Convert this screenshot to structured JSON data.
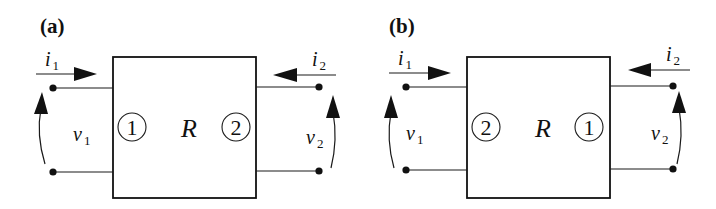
{
  "diagram": {
    "panels": [
      {
        "id": "a",
        "label": "(a)",
        "block_label": "R",
        "left_port_number": "1",
        "right_port_number": "2",
        "current_left": {
          "symbol": "i",
          "subscript": "1"
        },
        "current_right": {
          "symbol": "i",
          "subscript": "2"
        },
        "voltage_left": {
          "symbol": "v",
          "subscript": "1"
        },
        "voltage_right": {
          "symbol": "v",
          "subscript": "2"
        }
      },
      {
        "id": "b",
        "label": "(b)",
        "block_label": "R",
        "left_port_number": "2",
        "right_port_number": "1",
        "current_left": {
          "symbol": "i",
          "subscript": "1"
        },
        "current_right": {
          "symbol": "i",
          "subscript": "2"
        },
        "voltage_left": {
          "symbol": "v",
          "subscript": "1"
        },
        "voltage_right": {
          "symbol": "v",
          "subscript": "2"
        }
      }
    ],
    "colors": {
      "stroke": "#111111",
      "background": "#ffffff"
    }
  }
}
